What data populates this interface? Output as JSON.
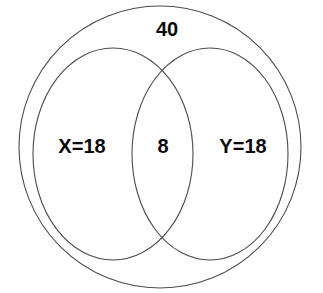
{
  "figure": {
    "type": "venn-diagram",
    "background_color": "#ffffff",
    "stroke_color": "#4c4c4c",
    "text_color": "#0a0a0a"
  },
  "universe": {
    "label": "40",
    "shape": "circle",
    "cx": 160,
    "cy": 147,
    "r": 141
  },
  "sets": [
    {
      "name": "set-x",
      "label": "X=18",
      "shape": "ellipse",
      "cx": 113,
      "cy": 154,
      "rx": 80,
      "ry": 106,
      "label_x": 82,
      "label_y": 148
    },
    {
      "name": "set-y",
      "label": "Y=18",
      "shape": "ellipse",
      "cx": 210,
      "cy": 154,
      "rx": 78,
      "ry": 106,
      "label_x": 243,
      "label_y": 148
    }
  ],
  "intersection": {
    "name": "set-x-and-y",
    "label": "8",
    "label_x": 163,
    "label_y": 148
  },
  "universe_label_position": {
    "x": 167,
    "y": 31
  },
  "chart_data": {
    "type": "venn",
    "title": "",
    "regions": [
      {
        "id": "X_only",
        "label": "X=18",
        "value": 18
      },
      {
        "id": "intersection",
        "label": "8",
        "value": 8
      },
      {
        "id": "Y_only",
        "label": "Y=18",
        "value": 18
      },
      {
        "id": "universe",
        "label": "40",
        "value": 40
      }
    ],
    "sets": [
      "X",
      "Y"
    ],
    "annotations": [
      "40",
      "X=18",
      "8",
      "Y=18"
    ]
  }
}
